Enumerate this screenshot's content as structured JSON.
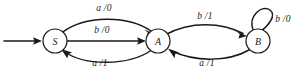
{
  "diagram": {
    "type": "finite-state-machine",
    "title": "",
    "states": [
      {
        "id": "S",
        "label": "S",
        "cx": 55,
        "cy": 41,
        "r": 12,
        "initial": true
      },
      {
        "id": "A",
        "label": "A",
        "cx": 158,
        "cy": 41,
        "r": 12,
        "initial": false
      },
      {
        "id": "B",
        "label": "B",
        "cx": 258,
        "cy": 41,
        "r": 12,
        "initial": false
      }
    ],
    "transitions": [
      {
        "from": "S",
        "to": "A",
        "label": "a /0",
        "shape": "arc-above",
        "label_x": 104,
        "label_y": 8
      },
      {
        "from": "S",
        "to": "A",
        "label": "b /0",
        "shape": "straight",
        "label_x": 102,
        "label_y": 30
      },
      {
        "from": "A",
        "to": "S",
        "label": "a /1",
        "shape": "arc-below",
        "label_x": 100,
        "label_y": 63
      },
      {
        "from": "A",
        "to": "B",
        "label": "b /1",
        "shape": "arc-above",
        "label_x": 205,
        "label_y": 16
      },
      {
        "from": "B",
        "to": "A",
        "label": "a /1",
        "shape": "arc-below",
        "label_x": 207,
        "label_y": 63
      },
      {
        "from": "B",
        "to": "B",
        "label": "b /0",
        "shape": "self-loop",
        "label_x": 283,
        "label_y": 19
      }
    ],
    "start_arrow": {
      "x1": 4,
      "y1": 41,
      "x2": 41,
      "y2": 41
    },
    "colors": {
      "stroke": "#1a1a1a",
      "background": "#ffffff"
    }
  }
}
